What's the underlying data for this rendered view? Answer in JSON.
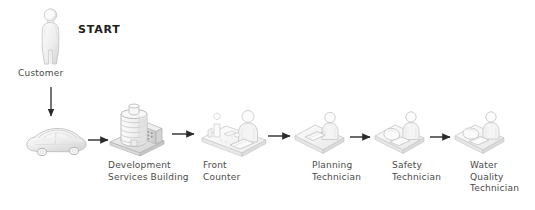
{
  "diagram": {
    "type": "process-flow",
    "title_badge": "START",
    "background_color": "#ffffff",
    "icon_color": "#e9e9e9",
    "icon_outline_color": "#b9b9b9",
    "arrow_color": "#2b2b2b",
    "text_color": "#4a4a4a",
    "nodes": [
      {
        "id": "customer",
        "label": "Customer",
        "icon": "person-icon",
        "x": 34,
        "y": 8
      },
      {
        "id": "car",
        "label": "",
        "icon": "car-icon",
        "x": 22,
        "y": 122
      },
      {
        "id": "development-services-building",
        "label": "Development\nServices Building",
        "icon": "office-building-icon",
        "x": 108,
        "y": 100
      },
      {
        "id": "front-counter",
        "label": "Front\nCounter",
        "icon": "front-counter-desk-icon",
        "x": 198,
        "y": 106
      },
      {
        "id": "planning-technician",
        "label": "Planning\nTechnician",
        "icon": "technician-desk-icon",
        "x": 292,
        "y": 110
      },
      {
        "id": "safety-technician",
        "label": "Safety\nTechnician",
        "icon": "technician-desk-icon",
        "x": 372,
        "y": 110
      },
      {
        "id": "water-quality-technician",
        "label": "Water\nQuality\nTechnician",
        "icon": "technician-desk-icon",
        "x": 452,
        "y": 110
      }
    ],
    "connectors": [
      {
        "id": "customer-to-car",
        "from": "customer",
        "to": "car",
        "direction": "down"
      },
      {
        "id": "car-to-building",
        "from": "car",
        "to": "development-services-building",
        "direction": "right"
      },
      {
        "id": "building-to-front-counter",
        "from": "development-services-building",
        "to": "front-counter",
        "direction": "right"
      },
      {
        "id": "front-counter-to-planning",
        "from": "front-counter",
        "to": "planning-technician",
        "direction": "right"
      },
      {
        "id": "planning-to-safety",
        "from": "planning-technician",
        "to": "safety-technician",
        "direction": "right"
      },
      {
        "id": "safety-to-water-quality",
        "from": "safety-technician",
        "to": "water-quality-technician",
        "direction": "right"
      }
    ]
  }
}
